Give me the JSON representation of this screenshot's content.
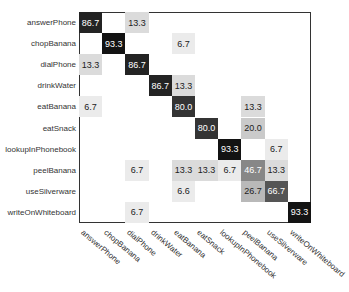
{
  "chart_data": {
    "type": "heatmap",
    "title": "",
    "xlabel": "",
    "ylabel": "",
    "rows": [
      "answerPhone",
      "chopBanana",
      "dialPhone",
      "drinkWater",
      "eatBanana",
      "eatSnack",
      "lookupInPhonebook",
      "peelBanana",
      "useSilverware",
      "writeOnWhiteboard"
    ],
    "columns": [
      "answerPhone",
      "chopBanana",
      "dialPhone",
      "drinkWater",
      "eatBanana",
      "eatSnack",
      "lookupInPhonebook",
      "peelBanana",
      "useSilverware",
      "writeOnWhiteboard"
    ],
    "values": [
      [
        86.7,
        null,
        13.3,
        null,
        null,
        null,
        null,
        null,
        null,
        null
      ],
      [
        null,
        93.3,
        null,
        null,
        6.7,
        null,
        null,
        null,
        null,
        null
      ],
      [
        13.3,
        null,
        86.7,
        null,
        null,
        null,
        null,
        null,
        null,
        null
      ],
      [
        null,
        null,
        null,
        86.7,
        13.3,
        null,
        null,
        null,
        null,
        null
      ],
      [
        6.7,
        null,
        null,
        null,
        80.0,
        null,
        null,
        13.3,
        null,
        null
      ],
      [
        null,
        null,
        null,
        null,
        null,
        80.0,
        null,
        20.0,
        null,
        null
      ],
      [
        null,
        null,
        null,
        null,
        null,
        null,
        93.3,
        null,
        6.7,
        null
      ],
      [
        null,
        null,
        6.7,
        null,
        13.3,
        13.3,
        6.7,
        46.7,
        13.3,
        null
      ],
      [
        null,
        null,
        null,
        null,
        6.6,
        null,
        null,
        26.7,
        66.7,
        null
      ],
      [
        null,
        null,
        6.7,
        null,
        null,
        null,
        null,
        null,
        null,
        93.3
      ]
    ],
    "color_scale": "grayscale (white=0, black=100)",
    "value_range": [
      0,
      100
    ],
    "legend": "none",
    "grid": false
  }
}
